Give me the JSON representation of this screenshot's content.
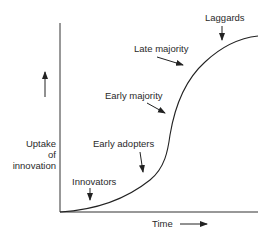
{
  "diagram": {
    "type": "diffusion-of-innovations-s-curve",
    "axes": {
      "x_label": "Time",
      "y_label_lines": [
        "Uptake",
        "of",
        "innovation"
      ]
    },
    "stages": [
      {
        "label": "Innovators"
      },
      {
        "label": "Early adopters"
      },
      {
        "label": "Early majority"
      },
      {
        "label": "Late majority"
      },
      {
        "label": "Laggards"
      }
    ],
    "colors": {
      "line": "#222222",
      "text": "#2a2a2a",
      "background": "#ffffff"
    }
  }
}
